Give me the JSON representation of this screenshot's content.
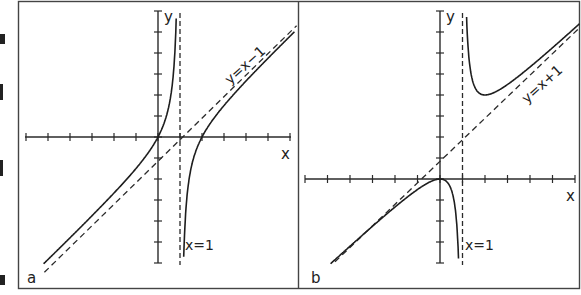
{
  "chart_data": [
    {
      "type": "line",
      "panel_label": "a",
      "title": "",
      "xlabel": "x",
      "ylabel": "y",
      "function": "y = x(x-2)/(x-1) = x - 1 - 1/(x-1)",
      "xlim": [
        -6,
        6
      ],
      "ylim": [
        -6,
        6
      ],
      "grid": false,
      "x_ticks": [
        -6,
        -5,
        -4,
        -3,
        -2,
        -1,
        0,
        1,
        2,
        3,
        4,
        5,
        6
      ],
      "y_ticks": [
        -6,
        -5,
        -4,
        -3,
        -2,
        -1,
        0,
        1,
        2,
        3,
        4,
        5,
        6
      ],
      "asymptotes": [
        {
          "type": "vertical",
          "label": "x=1",
          "x": 1
        },
        {
          "type": "oblique",
          "label": "y=x-1",
          "slope": 1,
          "intercept": -1
        }
      ],
      "key_points": [
        {
          "x": 0,
          "y": 0
        },
        {
          "x": 2,
          "y": 0
        }
      ],
      "series": [
        {
          "name": "left branch",
          "x_range": [
            -5.2,
            0.93
          ]
        },
        {
          "name": "right branch",
          "x_range": [
            1.05,
            6.2
          ]
        }
      ]
    },
    {
      "type": "line",
      "panel_label": "b",
      "title": "",
      "xlabel": "x",
      "ylabel": "y",
      "function": "y = x^2/(x-1) = x + 1 + 1/(x-1)",
      "xlim": [
        -6,
        6
      ],
      "ylim": [
        -4,
        8
      ],
      "grid": false,
      "x_ticks": [
        -6,
        -5,
        -4,
        -3,
        -2,
        -1,
        0,
        1,
        2,
        3,
        4,
        5,
        6
      ],
      "y_ticks": [
        -4,
        -3,
        -2,
        -1,
        0,
        1,
        2,
        3,
        4,
        5,
        6,
        7,
        8
      ],
      "asymptotes": [
        {
          "type": "vertical",
          "label": "x=1",
          "x": 1
        },
        {
          "type": "oblique",
          "label": "y=x+1",
          "slope": 1,
          "intercept": 1
        }
      ],
      "key_points": [
        {
          "x": 0,
          "y": 0,
          "kind": "local max"
        },
        {
          "x": 2,
          "y": 4,
          "kind": "local min"
        }
      ],
      "series": [
        {
          "name": "left branch",
          "x_range": [
            -4.9,
            0.86
          ]
        },
        {
          "name": "right branch",
          "x_range": [
            1.13,
            6.2
          ]
        }
      ]
    }
  ],
  "panels": [
    {
      "label": "a",
      "x_axis_label": "x",
      "y_axis_label": "y",
      "vertical_asymptote_label": "x=1",
      "oblique_asymptote_label": "y=x−1"
    },
    {
      "label": "b",
      "x_axis_label": "x",
      "y_axis_label": "y",
      "vertical_asymptote_label": "x=1",
      "oblique_asymptote_label": "y=x+1"
    }
  ]
}
